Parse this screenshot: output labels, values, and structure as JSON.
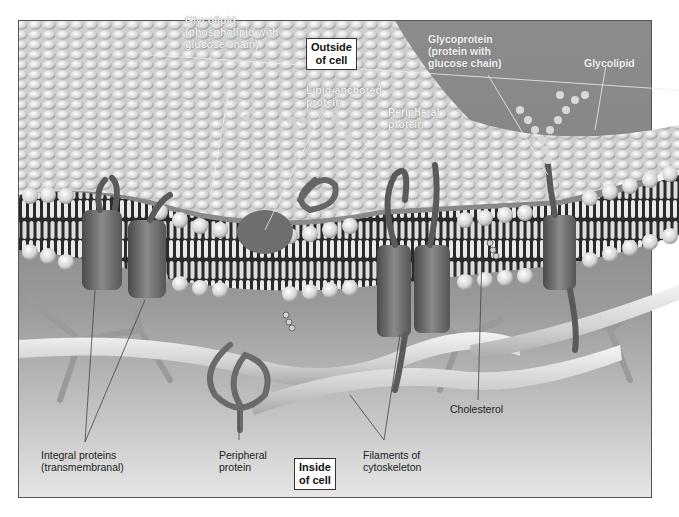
{
  "figure": {
    "regions": {
      "outside": "Outside of cell",
      "outside_line1": "Outside",
      "outside_line2": "of cell",
      "inside": "Inside of cell",
      "inside_line1": "Inside",
      "inside_line2": "of cell"
    },
    "labels_outside": [
      {
        "id": "glycolipid-1",
        "line1": "Glycolipid",
        "line2": "(phospholipid with",
        "line3": "glucose chain)"
      },
      {
        "id": "lipid-anchored",
        "line1": "Lipid-anchored",
        "line2": "protein"
      },
      {
        "id": "peripheral-top",
        "line1": "Peripheral",
        "line2": "protein"
      },
      {
        "id": "glycoprotein",
        "line1": "Glycoprotein",
        "line2": "(protein with",
        "line3": "glucose chain)"
      },
      {
        "id": "glycolipid-2",
        "line1": "Glycolipid"
      }
    ],
    "labels_inside": [
      {
        "id": "integral",
        "line1": "Integral proteins",
        "line2": "(transmembranal)"
      },
      {
        "id": "peripheral-bottom",
        "line1": "Peripheral",
        "line2": "protein"
      },
      {
        "id": "filaments",
        "line1": "Filaments of",
        "line2": "cytoskeleton"
      },
      {
        "id": "cholesterol",
        "line1": "Cholesterol"
      }
    ],
    "colors": {
      "outside_bg": "#878787",
      "inside_bg_light": "#e6e6e6",
      "phospholipid_head": "#e8e8e8",
      "protein": "#6e6e6e",
      "label_outside_text": "#f2f2f2",
      "label_inside_text": "#222222"
    }
  }
}
